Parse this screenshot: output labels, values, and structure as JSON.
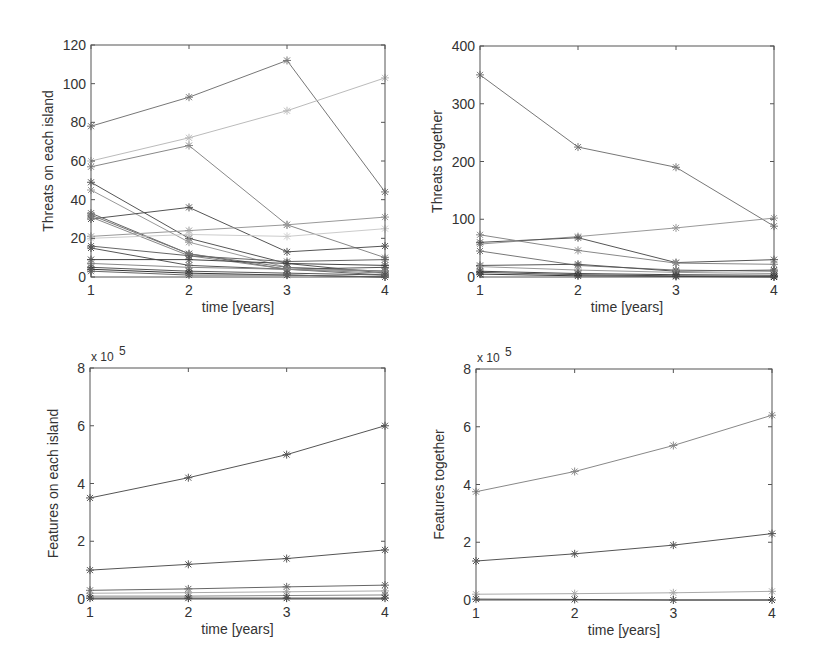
{
  "chart_data": [
    {
      "id": "tl",
      "type": "line",
      "box": [
        91,
        45,
        385,
        277
      ],
      "xlabel": "time [years]",
      "ylabel": "Threats on each island",
      "exponent": "",
      "x": [
        1,
        2,
        3,
        4
      ],
      "xticks": [
        "1",
        "2",
        "3",
        "4"
      ],
      "ylim": [
        0,
        120
      ],
      "yticks": [
        "0",
        "20",
        "40",
        "60",
        "80",
        "100",
        "120"
      ],
      "marker": "*",
      "series": [
        {
          "values": [
            78,
            93,
            112,
            44
          ],
          "color": "#777777"
        },
        {
          "values": [
            60,
            72,
            86,
            103
          ],
          "color": "#bbbbbb"
        },
        {
          "values": [
            57,
            68,
            27,
            10
          ],
          "color": "#888888"
        },
        {
          "values": [
            49,
            20,
            7,
            2
          ],
          "color": "#555555"
        },
        {
          "values": [
            45,
            18,
            5,
            3
          ],
          "color": "#999999"
        },
        {
          "values": [
            30,
            36,
            13,
            16
          ],
          "color": "#555555"
        },
        {
          "values": [
            33,
            12,
            4,
            1
          ],
          "color": "#666666"
        },
        {
          "values": [
            32,
            12,
            5,
            3
          ],
          "color": "#777777"
        },
        {
          "values": [
            31,
            11,
            4,
            2
          ],
          "color": "#888888"
        },
        {
          "values": [
            21,
            24,
            27,
            31
          ],
          "color": "#999999"
        },
        {
          "values": [
            20,
            22,
            21,
            25
          ],
          "color": "#cccccc"
        },
        {
          "values": [
            16,
            11,
            8,
            9
          ],
          "color": "#666666"
        },
        {
          "values": [
            15,
            6,
            4,
            5
          ],
          "color": "#555555"
        },
        {
          "values": [
            9,
            9,
            7,
            6
          ],
          "color": "#444444"
        },
        {
          "values": [
            7,
            5,
            4,
            3
          ],
          "color": "#888888"
        },
        {
          "values": [
            5,
            3,
            2,
            1
          ],
          "color": "#555555"
        },
        {
          "values": [
            4,
            2,
            1,
            0
          ],
          "color": "#333333"
        },
        {
          "values": [
            3,
            1,
            1,
            0
          ],
          "color": "#666666"
        }
      ]
    },
    {
      "id": "tr",
      "type": "line",
      "box": [
        480,
        46,
        774,
        277
      ],
      "xlabel": "time [years]",
      "ylabel": "Threats together",
      "exponent": "",
      "x": [
        1,
        2,
        3,
        4
      ],
      "xticks": [
        "1",
        "2",
        "3",
        "4"
      ],
      "ylim": [
        0,
        400
      ],
      "yticks": [
        "0",
        "100",
        "200",
        "300",
        "400"
      ],
      "marker": "*",
      "series": [
        {
          "values": [
            350,
            225,
            190,
            88
          ],
          "color": "#777777"
        },
        {
          "values": [
            57,
            70,
            85,
            102
          ],
          "color": "#999999"
        },
        {
          "values": [
            60,
            68,
            25,
            30
          ],
          "color": "#555555"
        },
        {
          "values": [
            73,
            46,
            24,
            22
          ],
          "color": "#888888"
        },
        {
          "values": [
            45,
            20,
            12,
            10
          ],
          "color": "#777777"
        },
        {
          "values": [
            20,
            22,
            10,
            12
          ],
          "color": "#555555"
        },
        {
          "values": [
            18,
            12,
            8,
            6
          ],
          "color": "#999999"
        },
        {
          "values": [
            10,
            6,
            4,
            3
          ],
          "color": "#444444"
        },
        {
          "values": [
            8,
            4,
            2,
            1
          ],
          "color": "#555555"
        },
        {
          "values": [
            5,
            2,
            1,
            0
          ],
          "color": "#333333"
        }
      ]
    },
    {
      "id": "bl",
      "type": "line",
      "box": [
        90,
        368,
        385,
        599
      ],
      "xlabel": "time [years]",
      "ylabel": "Features on each island",
      "exponent": "5",
      "x": [
        1,
        2,
        3,
        4
      ],
      "xticks": [
        "1",
        "2",
        "3",
        "4"
      ],
      "ylim": [
        0,
        8
      ],
      "yticks": [
        "0",
        "2",
        "4",
        "6",
        "8"
      ],
      "marker": "*",
      "series": [
        {
          "values": [
            3.5,
            4.2,
            5.0,
            6.0
          ],
          "color": "#555555"
        },
        {
          "values": [
            1.0,
            1.2,
            1.4,
            1.7
          ],
          "color": "#555555"
        },
        {
          "values": [
            0.3,
            0.35,
            0.42,
            0.48
          ],
          "color": "#666666"
        },
        {
          "values": [
            0.2,
            0.22,
            0.25,
            0.28
          ],
          "color": "#aaaaaa"
        },
        {
          "values": [
            0.1,
            0.1,
            0.12,
            0.14
          ],
          "color": "#888888"
        },
        {
          "values": [
            0.03,
            0.03,
            0.03,
            0.03
          ],
          "color": "#333333"
        }
      ]
    },
    {
      "id": "br",
      "type": "line",
      "box": [
        476,
        369,
        772,
        600
      ],
      "xlabel": "time [years]",
      "ylabel": "Features together",
      "exponent": "5",
      "x": [
        1,
        2,
        3,
        4
      ],
      "xticks": [
        "1",
        "2",
        "3",
        "4"
      ],
      "ylim": [
        0,
        8
      ],
      "yticks": [
        "0",
        "2",
        "4",
        "6",
        "8"
      ],
      "marker": "*",
      "series": [
        {
          "values": [
            3.75,
            4.45,
            5.35,
            6.4
          ],
          "color": "#888888"
        },
        {
          "values": [
            1.35,
            1.6,
            1.9,
            2.3
          ],
          "color": "#555555"
        },
        {
          "values": [
            0.2,
            0.22,
            0.25,
            0.3
          ],
          "color": "#aaaaaa"
        },
        {
          "values": [
            0.03,
            0.02,
            0.0,
            0.0
          ],
          "color": "#444444"
        }
      ]
    }
  ]
}
